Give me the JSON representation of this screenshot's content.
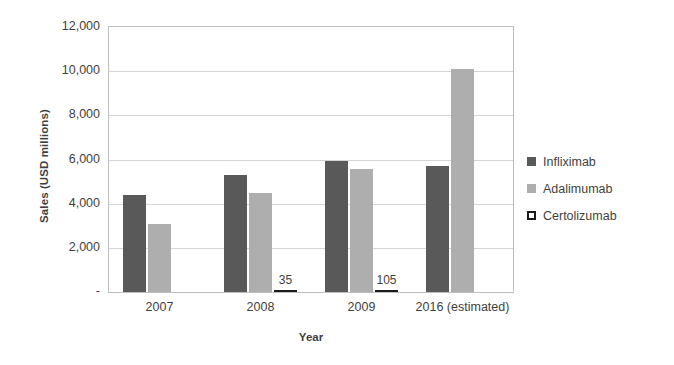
{
  "chart_data": {
    "type": "bar",
    "title": "",
    "xlabel": "Year",
    "ylabel": "Sales (USD millions)",
    "categories": [
      "2007",
      "2008",
      "2009",
      "2016 (estimated)"
    ],
    "series": [
      {
        "name": "Infliximab",
        "color": "#595959",
        "values": [
          4400,
          5300,
          5950,
          5700
        ]
      },
      {
        "name": "Adalimumab",
        "color": "#aeaeae",
        "values": [
          3100,
          4500,
          5550,
          10100
        ]
      },
      {
        "name": "Certolizumab",
        "color": "#1a1a1a",
        "values": [
          0,
          35,
          105,
          0
        ]
      }
    ],
    "point_labels": [
      {
        "series": "Certolizumab",
        "category": "2008",
        "text": "35"
      },
      {
        "series": "Certolizumab",
        "category": "2009",
        "text": "105"
      }
    ],
    "ylim": [
      0,
      12000
    ],
    "ytick_values": [
      12000,
      10000,
      8000,
      6000,
      4000,
      2000,
      0
    ],
    "ytick_labels": [
      "12,000",
      "10,000",
      "8,000",
      "6,000",
      "4,000",
      "2,000",
      "-"
    ],
    "grid": true,
    "legend_position": "right"
  }
}
